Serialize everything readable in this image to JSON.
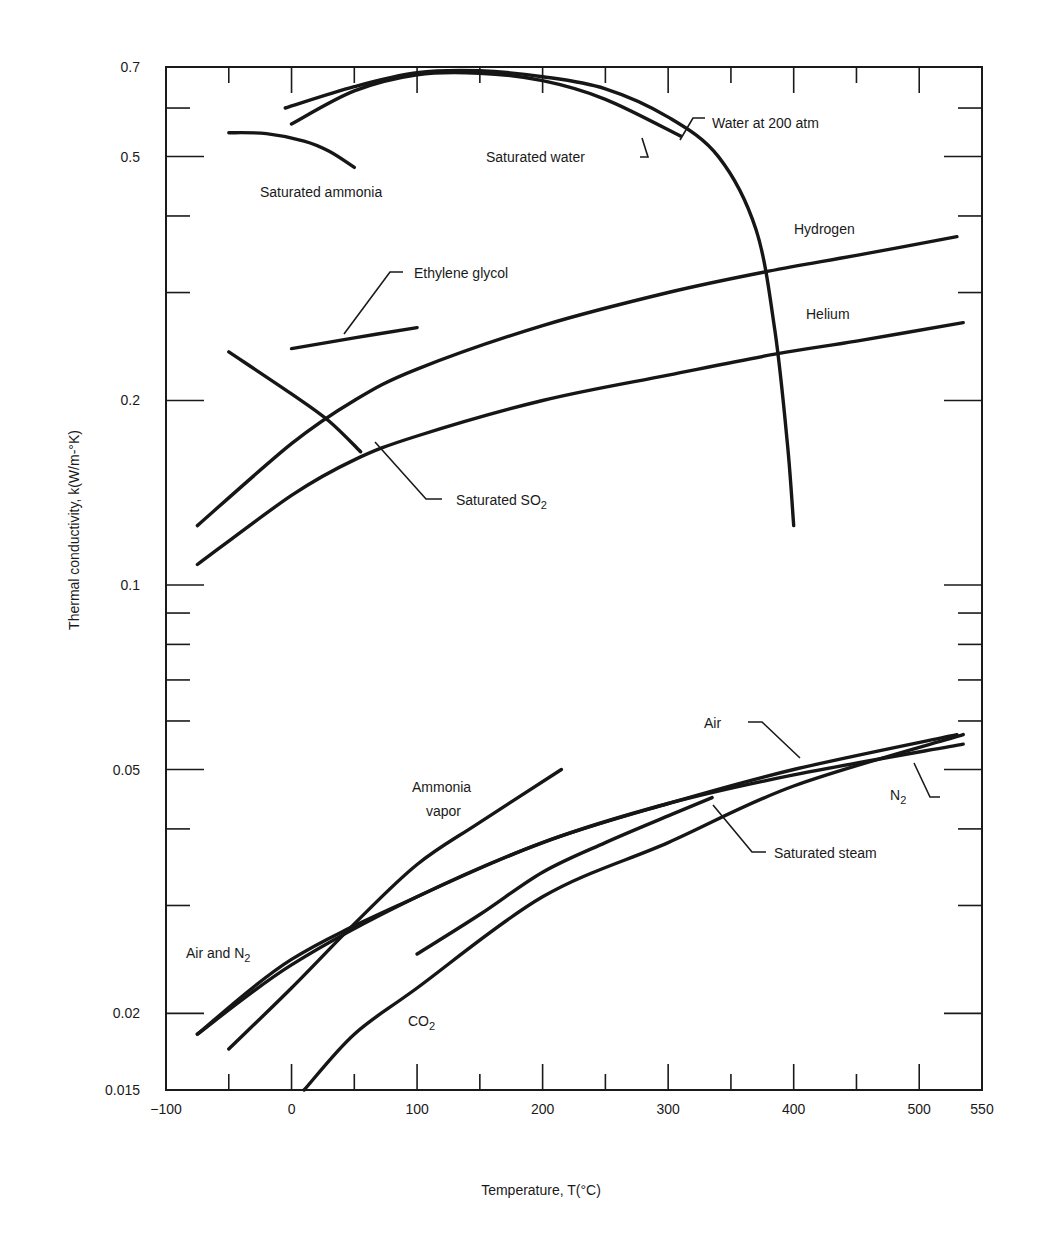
{
  "chart_data": {
    "type": "line",
    "title": "",
    "xlabel": "Temperature, T(°C)",
    "ylabel": "Thermal conductivity, k(W/m-°K)",
    "xlim": [
      -100,
      550
    ],
    "ylim": [
      0.015,
      0.7
    ],
    "yscale": "log",
    "grid": false,
    "legend": "none (curves labeled directly)",
    "x_ticks": [
      -100,
      0,
      100,
      200,
      300,
      400,
      500,
      550
    ],
    "x_minor_ticks": [
      -50,
      50,
      150,
      250,
      350,
      450
    ],
    "y_ticks": [
      0.015,
      0.02,
      0.05,
      0.1,
      0.2,
      0.5,
      0.7
    ],
    "y_tick_labels": [
      "0.015",
      "0.02",
      "0.05",
      "0.1",
      "0.2",
      "0.5",
      "0.7"
    ],
    "y_minor_ticks": [
      0.03,
      0.04,
      0.06,
      0.07,
      0.08,
      0.09,
      0.3,
      0.4,
      0.6
    ],
    "series": [
      {
        "name": "Saturated water",
        "x": [
          0,
          50,
          100,
          150,
          200,
          250,
          310
        ],
        "y": [
          0.565,
          0.64,
          0.68,
          0.684,
          0.665,
          0.62,
          0.54
        ]
      },
      {
        "name": "Water at 200 atm",
        "x": [
          -5,
          50,
          100,
          150,
          200,
          250,
          300,
          340,
          370,
          385,
          395,
          400
        ],
        "y": [
          0.6,
          0.65,
          0.685,
          0.69,
          0.675,
          0.645,
          0.58,
          0.5,
          0.38,
          0.26,
          0.17,
          0.125
        ]
      },
      {
        "name": "Saturated ammonia",
        "x": [
          -50,
          -20,
          10,
          30,
          50
        ],
        "y": [
          0.547,
          0.545,
          0.53,
          0.51,
          0.48
        ]
      },
      {
        "name": "Ethylene glycol",
        "x": [
          0,
          50,
          100
        ],
        "y": [
          0.243,
          0.253,
          0.263
        ]
      },
      {
        "name": "Hydrogen",
        "x": [
          -75,
          0,
          50,
          100,
          200,
          300,
          380,
          450,
          530
        ],
        "y": [
          0.125,
          0.17,
          0.2,
          0.225,
          0.265,
          0.3,
          0.325,
          0.345,
          0.37
        ]
      },
      {
        "name": "Helium",
        "x": [
          -75,
          0,
          50,
          100,
          200,
          300,
          385,
          450,
          535
        ],
        "y": [
          0.108,
          0.14,
          0.16,
          0.175,
          0.2,
          0.22,
          0.238,
          0.25,
          0.268
        ]
      },
      {
        "name": "Saturated SO2",
        "x": [
          -50,
          0,
          30,
          55
        ],
        "y": [
          0.24,
          0.205,
          0.185,
          0.165
        ]
      },
      {
        "name": "Air",
        "x": [
          -75,
          0,
          100,
          200,
          300,
          400,
          530
        ],
        "y": [
          0.0185,
          0.0245,
          0.031,
          0.038,
          0.044,
          0.05,
          0.057
        ]
      },
      {
        "name": "N2",
        "x": [
          -75,
          0,
          100,
          200,
          300,
          400,
          535
        ],
        "y": [
          0.0185,
          0.024,
          0.031,
          0.038,
          0.044,
          0.049,
          0.055
        ]
      },
      {
        "name": "Ammonia vapor",
        "x": [
          -50,
          0,
          50,
          100,
          150,
          215
        ],
        "y": [
          0.0175,
          0.022,
          0.028,
          0.035,
          0.041,
          0.05
        ]
      },
      {
        "name": "Saturated steam",
        "x": [
          100,
          150,
          200,
          250,
          300,
          335
        ],
        "y": [
          0.025,
          0.029,
          0.034,
          0.038,
          0.042,
          0.045
        ]
      },
      {
        "name": "CO2",
        "x": [
          10,
          50,
          100,
          200,
          300,
          400,
          535
        ],
        "y": [
          0.015,
          0.0185,
          0.022,
          0.031,
          0.038,
          0.047,
          0.057
        ]
      }
    ],
    "annotations": [
      "Saturated water",
      "Water at 200 atm",
      "Saturated ammonia",
      "Ethylene glycol",
      "Hydrogen",
      "Helium",
      "Saturated SO2",
      "Air",
      "N2",
      "Ammonia vapor",
      "Saturated steam",
      "Air and N2",
      "CO2"
    ]
  },
  "labels": {
    "x_axis_title": "Temperature, T(°C)",
    "y_axis_title": "Thermal conductivity, k(W/m-°K)",
    "saturated_water": "Saturated water",
    "water_200atm": "Water at 200 atm",
    "saturated_ammonia": "Saturated ammonia",
    "ethylene_glycol": "Ethylene glycol",
    "hydrogen": "Hydrogen",
    "helium": "Helium",
    "saturated_so2": "Saturated SO",
    "so2_sub": "2",
    "air": "Air",
    "n2": "N",
    "n2_sub": "2",
    "ammonia_vapor_1": "Ammonia",
    "ammonia_vapor_2": "vapor",
    "saturated_steam": "Saturated steam",
    "air_and_n2": "Air and N",
    "air_and_n2_sub": "2",
    "co2": "CO",
    "co2_sub": "2"
  },
  "colors": {
    "ink": "#161616",
    "background": "#ffffff"
  }
}
